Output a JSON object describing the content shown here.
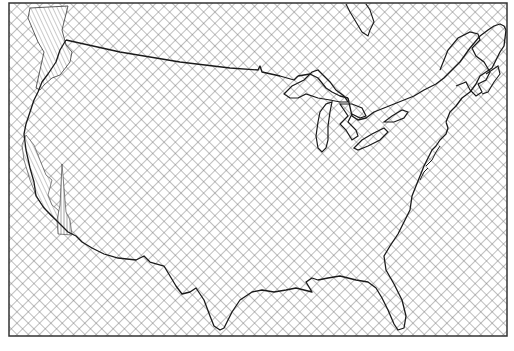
{
  "map": {
    "subject": "Contiguous United States outline",
    "style": "black-and-white line map with crosshatch fill",
    "colors": {
      "background": "#ffffff",
      "hatch": "#707070",
      "outline": "#1a1a1a",
      "frame": "#333333",
      "vertical_hatch": "#555555"
    },
    "frame": {
      "x": 9,
      "y": 3,
      "width": 498,
      "height": 333
    },
    "regions": [
      {
        "name": "land-and-sea",
        "fill": "crosshatch"
      },
      {
        "name": "pacific-northwest-zone",
        "fill": "diagonal-hatch"
      },
      {
        "name": "california-coastal-zone",
        "fill": "diagonal-hatch"
      },
      {
        "name": "southern-california-zone",
        "fill": "vertical-hatch"
      }
    ],
    "features": [
      "us-canada-border",
      "great-lakes",
      "pacific-coast",
      "atlantic-coast",
      "gulf-coast",
      "florida-peninsula",
      "maine-coast"
    ]
  }
}
